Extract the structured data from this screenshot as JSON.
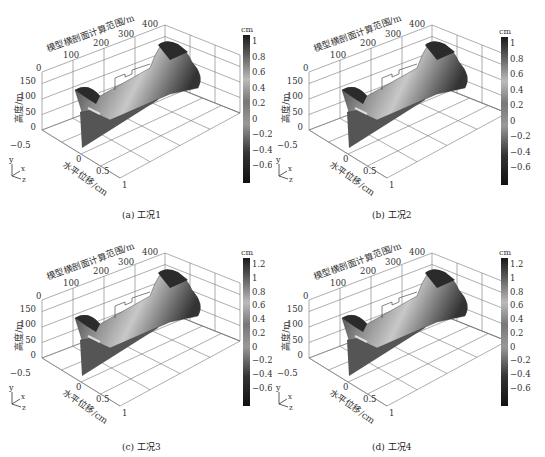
{
  "figure": {
    "panels": [
      {
        "id": "a",
        "caption": "(a) 工况1",
        "colorbar": {
          "unit": "cm",
          "ticks": [
            "1",
            "0.8",
            "0.6",
            "0.4",
            "0.2",
            "0",
            "−0.2",
            "−0.4",
            "−0.6"
          ],
          "max": 1.1,
          "min": -0.75
        }
      },
      {
        "id": "b",
        "caption": "(b) 工况2",
        "colorbar": {
          "unit": "cm",
          "ticks": [
            "1",
            "0.8",
            "0.6",
            "0.4",
            "0.2",
            "0",
            "−0.2",
            "−0.4",
            "−0.6"
          ],
          "max": 1.15,
          "min": -0.75
        }
      },
      {
        "id": "c",
        "caption": "(c) 工况3",
        "colorbar": {
          "unit": "cm",
          "ticks": [
            "1.2",
            "1",
            "0.8",
            "0.6",
            "0.4",
            "0.2",
            "0",
            "−0.2",
            "−0.4",
            "−0.6"
          ],
          "max": 1.25,
          "min": -0.75
        }
      },
      {
        "id": "d",
        "caption": "(d) 工况4",
        "colorbar": {
          "unit": "cm",
          "ticks": [
            "1.2",
            "1",
            "0.8",
            "0.6",
            "0.4",
            "0.2",
            "0",
            "−0.2",
            "−0.4",
            "−0.6"
          ],
          "max": 1.25,
          "min": -0.75
        }
      }
    ],
    "axes": {
      "section_label": "模型横剖面计算范围/m",
      "section_ticks": [
        "0",
        "100",
        "200",
        "300",
        "400"
      ],
      "height_label": "高度/m",
      "height_ticks": [
        "0",
        "50",
        "100",
        "150"
      ],
      "disp_label": "水平位移/cm",
      "disp_ticks": [
        "−0.5",
        "0",
        "0.5",
        "1"
      ],
      "triad": {
        "y": "y",
        "x": "x",
        "z": "z"
      }
    }
  },
  "chart_data": [
    {
      "type": "surface3d",
      "title": "(a) 工况1",
      "xlabel": "模型横剖面计算范围/m",
      "ylabel": "高度/m",
      "zlabel": "水平位移/cm",
      "x_ticks": [
        0,
        100,
        200,
        300,
        400
      ],
      "y_ticks": [
        0,
        50,
        100,
        150
      ],
      "z_ticks": [
        -0.5,
        0,
        0.5,
        1
      ],
      "colorbar": {
        "label": "cm",
        "range": [
          -0.7,
          1.1
        ],
        "ticks": [
          1,
          0.8,
          0.6,
          0.4,
          0.2,
          0,
          -0.2,
          -0.4,
          -0.6
        ]
      }
    },
    {
      "type": "surface3d",
      "title": "(b) 工况2",
      "xlabel": "模型横剖面计算范围/m",
      "ylabel": "高度/m",
      "zlabel": "水平位移/cm",
      "x_ticks": [
        0,
        100,
        200,
        300,
        400
      ],
      "y_ticks": [
        0,
        50,
        100,
        150
      ],
      "z_ticks": [
        -0.5,
        0,
        0.5,
        1
      ],
      "colorbar": {
        "label": "cm",
        "range": [
          -0.7,
          1.15
        ],
        "ticks": [
          1,
          0.8,
          0.6,
          0.4,
          0.2,
          0,
          -0.2,
          -0.4,
          -0.6
        ]
      }
    },
    {
      "type": "surface3d",
      "title": "(c) 工况3",
      "xlabel": "模型横剖面计算范围/m",
      "ylabel": "高度/m",
      "zlabel": "水平位移/cm",
      "x_ticks": [
        0,
        100,
        200,
        300,
        400
      ],
      "y_ticks": [
        0,
        50,
        100,
        150
      ],
      "z_ticks": [
        -0.5,
        0,
        0.5,
        1
      ],
      "colorbar": {
        "label": "cm",
        "range": [
          -0.7,
          1.25
        ],
        "ticks": [
          1.2,
          1,
          0.8,
          0.6,
          0.4,
          0.2,
          0,
          -0.2,
          -0.4,
          -0.6
        ]
      }
    },
    {
      "type": "surface3d",
      "title": "(d) 工况4",
      "xlabel": "模型横剖面计算范围/m",
      "ylabel": "高度/m",
      "zlabel": "水平位移/cm",
      "x_ticks": [
        0,
        100,
        200,
        300,
        400
      ],
      "y_ticks": [
        0,
        50,
        100,
        150
      ],
      "z_ticks": [
        -0.5,
        0,
        0.5,
        1
      ],
      "colorbar": {
        "label": "cm",
        "range": [
          -0.7,
          1.25
        ],
        "ticks": [
          1.2,
          1,
          0.8,
          0.6,
          0.4,
          0.2,
          0,
          -0.2,
          -0.4,
          -0.6
        ]
      }
    }
  ]
}
